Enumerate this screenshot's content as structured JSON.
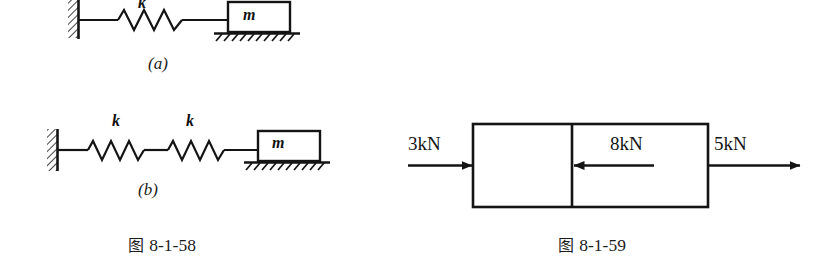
{
  "figure_left": {
    "caption_cjk": "图",
    "caption_number": "8-1-58",
    "caption_full": "图 8-1-58",
    "diagram_a": {
      "sublabel": "(a)",
      "spring_labels": [
        "k"
      ],
      "mass_label": "m",
      "description": "wall, one spring k, block m on hatched ground"
    },
    "diagram_b": {
      "sublabel": "(b)",
      "spring_labels": [
        "k",
        "k"
      ],
      "mass_label": "m",
      "description": "wall, two springs k in series, block m on hatched ground"
    }
  },
  "figure_right": {
    "caption_cjk": "图",
    "caption_number": "8-1-59",
    "caption_full": "图 8-1-59",
    "diagram": {
      "description": "two-segment bar with axial forces",
      "forces": [
        {
          "label": "3kN",
          "value": 3,
          "unit": "kN",
          "direction": "right",
          "location": "left-end"
        },
        {
          "label": "8kN",
          "value": 8,
          "unit": "kN",
          "direction": "left",
          "location": "middle-section"
        },
        {
          "label": "5kN",
          "value": 5,
          "unit": "kN",
          "direction": "right",
          "location": "right-end"
        }
      ]
    }
  },
  "colors": {
    "background": "#ffffff",
    "ink": "#141414",
    "caption_text": "#1c1c1c"
  }
}
